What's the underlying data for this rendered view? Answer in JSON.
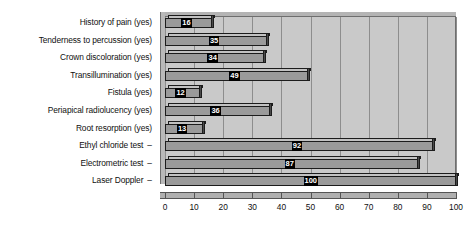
{
  "chart_data": {
    "type": "bar",
    "orientation": "horizontal",
    "title": "",
    "xlabel": "",
    "ylabel": "",
    "xlim": [
      0,
      100
    ],
    "xticks": [
      "0",
      "10",
      "20",
      "30",
      "40",
      "50",
      "60",
      "70",
      "80",
      "90",
      "100"
    ],
    "grid": true,
    "legend": false,
    "style": "3d-bar-grayscale",
    "categories": [
      "History of pain (yes)",
      "Tenderness to percussion (yes)",
      "Crown discoloration (yes)",
      "Transillumination (yes)",
      "Fistula (yes)",
      "Periapical radiolucency (yes)",
      "Root resorption (yes)",
      "Ethyl chloride test",
      "Electrometric test",
      "Laser Doppler"
    ],
    "category_suffixes": [
      "",
      "",
      "",
      "",
      "",
      "",
      "",
      "–",
      "–",
      "–"
    ],
    "values": [
      16,
      35,
      34,
      49,
      12,
      36,
      13,
      92,
      87,
      100
    ],
    "data_labels": [
      "16",
      "35",
      "34",
      "49",
      "12",
      "36",
      "13",
      "92",
      "87",
      "100"
    ],
    "colors": {
      "bar_face": "#9a9a9a",
      "bar_top": "#c2c2c2",
      "bar_side": "#4a4a4a",
      "bar_outline": "#1c1c1c",
      "plot_background": "#c9c9c9",
      "gridline": "#8d8d8d",
      "label_background": "#000000",
      "label_text": "#ffffff",
      "axis_text": "#101010"
    }
  }
}
